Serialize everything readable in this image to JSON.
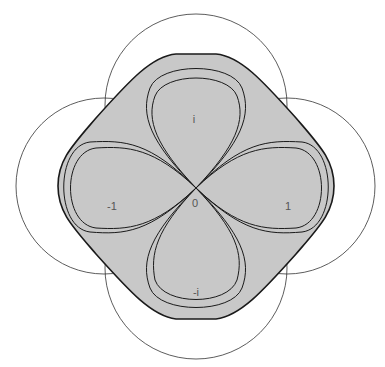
{
  "diagram": {
    "labels": {
      "top": "i",
      "left": "-1",
      "right": "1",
      "bottom": "-i",
      "center": "0"
    },
    "colors": {
      "fill": "#c8c8c8",
      "stroke": "#1a1a1a",
      "circle": "#333333",
      "background": "#ffffff"
    }
  }
}
